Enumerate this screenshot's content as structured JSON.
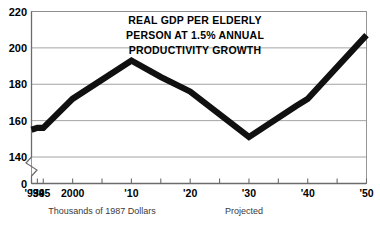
{
  "chart_data": {
    "type": "line",
    "title_lines": [
      "REAL GDP PER ELDERLY",
      "PERSON AT 1.5% ANNUAL",
      "PRODUCTIVITY GROWTH"
    ],
    "xlabel": "",
    "ylabel": "",
    "ylim": [
      140,
      220
    ],
    "y_axis_break": true,
    "y_break_label": "0",
    "ytick_labels": [
      "220",
      "200",
      "180",
      "160",
      "140"
    ],
    "ytick_values": [
      220,
      200,
      180,
      160,
      140
    ],
    "grid": true,
    "legend": false,
    "xtick_labels": [
      "'93",
      "'94",
      "'95",
      "2000",
      "'10",
      "'20",
      "'30",
      "'40",
      "'50"
    ],
    "x": [
      1993,
      1994,
      1995,
      2000,
      2010,
      2020,
      2030,
      2040,
      2050
    ],
    "xlim": [
      1993,
      2050
    ],
    "series": [
      {
        "name": "Real GDP per elderly person",
        "values": [
          155,
          156,
          156,
          172,
          193,
          183,
          151,
          170,
          207
        ]
      }
    ],
    "points": [
      {
        "x": 1993,
        "y": 155
      },
      {
        "x": 1994,
        "y": 156
      },
      {
        "x": 1995,
        "y": 156
      },
      {
        "x": 2000,
        "y": 172
      },
      {
        "x": 2010,
        "y": 193
      },
      {
        "x": 2015,
        "y": 184
      },
      {
        "x": 2020,
        "y": 176
      },
      {
        "x": 2030,
        "y": 151
      },
      {
        "x": 2038,
        "y": 168
      },
      {
        "x": 2040,
        "y": 172
      },
      {
        "x": 2050,
        "y": 207
      }
    ],
    "annotations": [
      {
        "text": "Thousands of 1987 Dollars",
        "position": "below-axis-left"
      },
      {
        "text": "Projected",
        "position": "below-axis-right"
      }
    ],
    "colors": {
      "line": "#101010",
      "grid": "#8c8c8c",
      "axis": "#6b6b6b",
      "text": "#000000",
      "caption": "#3a3a3a",
      "background": "#ffffff"
    }
  },
  "captions": {
    "left": "Thousands of 1987 Dollars",
    "right": "Projected"
  }
}
